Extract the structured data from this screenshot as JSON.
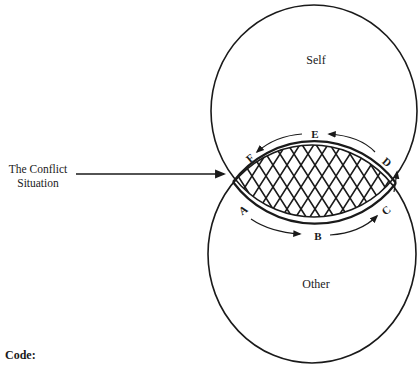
{
  "diagram": {
    "circles": {
      "top": {
        "label": "Self"
      },
      "bottom": {
        "label": "Other"
      }
    },
    "overlap": {
      "label_line1": "The Conflict",
      "label_line2": "Situation",
      "fill_pattern": "crosshatch"
    },
    "cycle_points": {
      "A": "A",
      "B": "B",
      "C": "C",
      "D": "D",
      "E": "E",
      "F": "F"
    },
    "code_label": "Code:",
    "colors": {
      "ink": "#1a1a1a",
      "background": "#ffffff"
    }
  }
}
